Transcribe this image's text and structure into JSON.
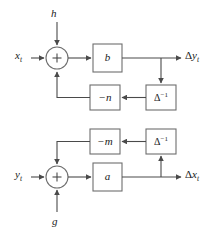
{
  "figure": {
    "type": "block-diagram",
    "title": "",
    "colors": {
      "background": "#ffffff",
      "wire": "#4a4a4a",
      "box_stroke": "#6e6e6e",
      "box_fill": "#ffffff",
      "text": "#1a1a1a"
    }
  },
  "top_diagram": {
    "input_label": "x",
    "input_sub": "t",
    "external_input_label": "h",
    "sum_symbol": "+",
    "gain_block": "b",
    "feedback_gain_block": "−n",
    "delay_block": "Δ",
    "delay_exponent": "−1",
    "output_delta": "Δ",
    "output_label": "y",
    "output_sub": "t"
  },
  "bottom_diagram": {
    "input_label": "y",
    "input_sub": "t",
    "external_input_label": "g",
    "sum_symbol": "+",
    "gain_block": "a",
    "feedback_gain_block": "−m",
    "delay_block": "Δ",
    "delay_exponent": "−1",
    "output_delta": "Δ",
    "output_label": "x",
    "output_sub": "t"
  }
}
